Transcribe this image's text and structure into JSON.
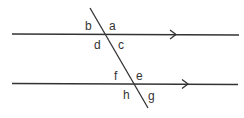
{
  "diagram": {
    "type": "parallel-lines-cut-by-transversal",
    "lines": [
      {
        "name": "top-parallel-line",
        "y": 34,
        "x1": 12,
        "x2": 239,
        "arrow_x": 175
      },
      {
        "name": "bottom-parallel-line",
        "y": 84,
        "x1": 12,
        "x2": 238,
        "arrow_x": 187
      }
    ],
    "transversal": {
      "x1": 90,
      "y1": 8,
      "x2": 148,
      "y2": 108
    },
    "angle_labels": [
      {
        "text": "b",
        "x": 85,
        "y": 30
      },
      {
        "text": "a",
        "x": 109,
        "y": 30
      },
      {
        "text": "d",
        "x": 94,
        "y": 49
      },
      {
        "text": "c",
        "x": 118,
        "y": 49
      },
      {
        "text": "f",
        "x": 114,
        "y": 80
      },
      {
        "text": "e",
        "x": 136,
        "y": 80
      },
      {
        "text": "h",
        "x": 123,
        "y": 99
      },
      {
        "text": "g",
        "x": 148,
        "y": 100
      }
    ],
    "stroke_color": "#333333"
  }
}
